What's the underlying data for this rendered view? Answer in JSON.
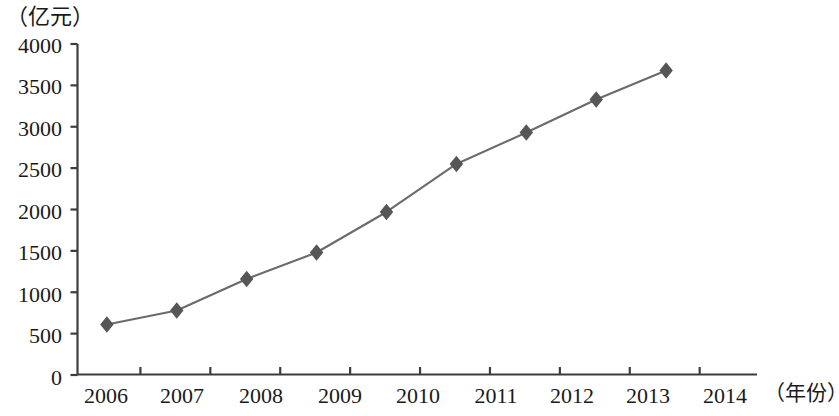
{
  "chart_data": {
    "type": "line",
    "title": "",
    "subtitle": "",
    "xlabel": "（年份）",
    "ylabel": "（亿元）",
    "categories": [
      "2006",
      "2007",
      "2008",
      "2009",
      "2010",
      "2011",
      "2012",
      "2013",
      "2014"
    ],
    "values": [
      610,
      780,
      1160,
      1480,
      1970,
      2550,
      2930,
      3330,
      3680
    ],
    "series": [
      {
        "name": "",
        "values": [
          610,
          780,
          1160,
          1480,
          1970,
          2550,
          2930,
          3330,
          3680
        ]
      }
    ],
    "ylim": [
      0,
      4000
    ],
    "ytick_labels": [
      "0",
      "500",
      "1000",
      "1500",
      "2000",
      "2500",
      "3000",
      "3500",
      "4000"
    ],
    "ytick_values": [
      0,
      500,
      1000,
      1500,
      2000,
      2500,
      3000,
      3500,
      4000
    ],
    "xtick_labels": [
      "2006",
      "2007",
      "2008",
      "2009",
      "2010",
      "2011",
      "2012",
      "2013",
      "2014"
    ],
    "grid": false,
    "legend": "none",
    "marker": "diamond",
    "marker_color": "#565656",
    "line_color": "#6b6b6b",
    "axis_color": "#3d3d3d"
  }
}
